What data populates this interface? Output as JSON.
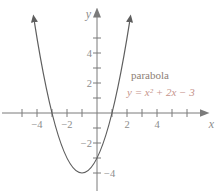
{
  "figure": {
    "background_color": "#ffffff",
    "axis_color": "#7b7b7b",
    "curve_color": "#5e5e5e",
    "tick_label_color": "#8d8d8d",
    "curve_label": "parabola",
    "curve_label_color": "#8c7e75",
    "equation": "y = x² + 2x − 3",
    "equation_color": "#c6948c",
    "x_axis_label": "x",
    "y_axis_label": "y",
    "x_tick_labels": [
      "−4",
      "−2",
      "2",
      "4"
    ],
    "y_tick_labels": [
      "4",
      "2",
      "−2",
      "−4"
    ]
  },
  "chart_data": {
    "type": "line",
    "title": "",
    "xlabel": "x",
    "ylabel": "y",
    "xlim": [
      -5.5,
      6.8
    ],
    "ylim": [
      -5.3,
      6.8
    ],
    "grid": false,
    "x_ticks": [
      -5,
      -4,
      -3,
      -2,
      -1,
      1,
      2,
      3,
      4,
      5,
      6
    ],
    "y_ticks": [
      -4,
      -3,
      -2,
      -1,
      1,
      2,
      3,
      4,
      5
    ],
    "x_tick_labels_shown": [
      "−4",
      "−2",
      "2",
      "4"
    ],
    "y_tick_labels_shown": [
      "4",
      "2",
      "−2",
      "−4"
    ],
    "series": [
      {
        "name": "parabola",
        "equation": "y = x^2 + 2x - 3",
        "coefficients": [
          1,
          2,
          -3
        ],
        "x_range": [
          -4.18,
          2.18
        ],
        "vertex": [
          -1,
          -4
        ],
        "x_intercepts": [
          -3,
          1
        ],
        "y_intercept": -3,
        "points": [
          [
            -4,
            5
          ],
          [
            -3,
            0
          ],
          [
            -2,
            -3
          ],
          [
            -1,
            -4
          ],
          [
            0,
            -3
          ],
          [
            1,
            0
          ],
          [
            2,
            5
          ]
        ]
      }
    ],
    "annotations": [
      {
        "text": "parabola",
        "x": 2.3,
        "y": 2.4
      },
      {
        "text": "y = x² + 2x − 3",
        "x": 2.0,
        "y": 1.15
      }
    ]
  }
}
